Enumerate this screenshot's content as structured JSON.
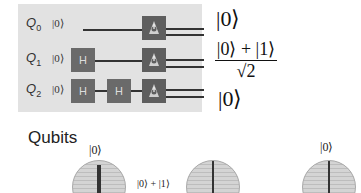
{
  "circuit": {
    "qubits": [
      {
        "label": "Q",
        "index": "0",
        "init": "|0⟩",
        "gates": [],
        "output": "|0⟩"
      },
      {
        "label": "Q",
        "index": "1",
        "init": "|0⟩",
        "gates": [
          "H"
        ],
        "output_numerator": "|0⟩ + |1⟩",
        "output_denominator": "√2"
      },
      {
        "label": "Q",
        "index": "2",
        "init": "|0⟩",
        "gates": [
          "H",
          "H"
        ],
        "output": "|0⟩"
      }
    ],
    "measure_icon": "measurement-icon",
    "background_color": "#e2e2e2",
    "gate_color": "#6a6a6a"
  },
  "qubits_section": {
    "title": "Qubits",
    "spheres": [
      {
        "state_label": "|0⟩"
      },
      {
        "state_label": "|0⟩ + |1⟩"
      },
      {
        "state_label": "|0⟩"
      }
    ]
  }
}
